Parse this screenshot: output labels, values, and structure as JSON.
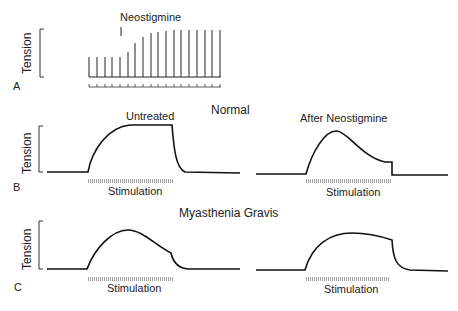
{
  "panel_a": {
    "letter": "A",
    "ylabel": "Tension",
    "drug_label": "Neostigmine",
    "twitch_bars": [
      {
        "x": 89,
        "top": 57
      },
      {
        "x": 97,
        "top": 57
      },
      {
        "x": 105,
        "top": 57
      },
      {
        "x": 112,
        "top": 57
      },
      {
        "x": 120,
        "top": 57
      },
      {
        "x": 128,
        "top": 52
      },
      {
        "x": 135,
        "top": 43
      },
      {
        "x": 143,
        "top": 37
      },
      {
        "x": 151,
        "top": 33
      },
      {
        "x": 158,
        "top": 32
      },
      {
        "x": 166,
        "top": 31
      },
      {
        "x": 174,
        "top": 30
      },
      {
        "x": 181,
        "top": 30
      },
      {
        "x": 189,
        "top": 30
      },
      {
        "x": 197,
        "top": 30
      },
      {
        "x": 205,
        "top": 30
      },
      {
        "x": 212,
        "top": 30
      },
      {
        "x": 220,
        "top": 30
      }
    ],
    "baseline_y": 77
  },
  "panel_b": {
    "letter": "B",
    "ylabel": "Tension",
    "group_title": "Normal",
    "left_label": "Untreated",
    "right_label": "After Neostigmine",
    "stimulation_label": "Stimulation"
  },
  "panel_c": {
    "letter": "C",
    "ylabel": "Tension",
    "group_title": "Myasthenia Gravis",
    "stimulation_label": "Stimulation"
  },
  "colors": {
    "trace": "#111111",
    "stim_bar": "#8a8a8a",
    "text": "#222222"
  },
  "chart_data": [
    {
      "type": "line",
      "title": "A: Twitch tension before and after Neostigmine",
      "ylabel": "Tension",
      "annotation": "Neostigmine (arrow at 5th stimulus)",
      "x": [
        1,
        2,
        3,
        4,
        5,
        6,
        7,
        8,
        9,
        10,
        11,
        12,
        13,
        14,
        15,
        16,
        17,
        18
      ],
      "values": [
        20,
        20,
        20,
        20,
        20,
        25,
        34,
        40,
        44,
        45,
        46,
        47,
        47,
        47,
        47,
        47,
        47,
        47
      ]
    },
    {
      "type": "line",
      "title": "B: Normal — Untreated",
      "ylabel": "Tension",
      "xlabel": "Stimulation",
      "description": "Rapid rise to sustained plateau during stimulation, rapid fall after"
    },
    {
      "type": "line",
      "title": "B: Normal — After Neostigmine",
      "ylabel": "Tension",
      "xlabel": "Stimulation",
      "description": "Rise to peak then fade during stimulation"
    },
    {
      "type": "line",
      "title": "C: Myasthenia Gravis — Untreated",
      "ylabel": "Tension",
      "xlabel": "Stimulation",
      "description": "Rise to peak then fade during stimulation"
    },
    {
      "type": "line",
      "title": "C: Myasthenia Gravis — After Neostigmine",
      "ylabel": "Tension",
      "xlabel": "Stimulation",
      "description": "Rise to near-sustained plateau with slight decline"
    }
  ]
}
